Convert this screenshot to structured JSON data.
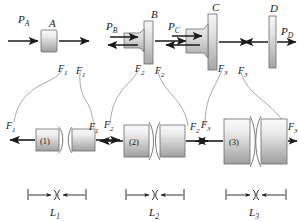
{
  "figure": {
    "kind": "free-body-diagram",
    "colors": {
      "ink": "#1a1a1a",
      "body_light": "#f0f0f0",
      "body_mid": "#c9c9c9",
      "body_dark": "#9a9a9a",
      "leader": "#8a8a8a",
      "background": "#ffffff"
    }
  },
  "top_row": {
    "bodies": [
      {
        "id": "A",
        "label": "A",
        "shape": "small-block",
        "applied_load": {
          "label": "P",
          "sub": "A",
          "display": "PA",
          "direction": "right"
        },
        "internal_force": {
          "label": "F",
          "sub": "1",
          "display": "F1",
          "direction": "right"
        }
      },
      {
        "id": "B",
        "label": "B",
        "shape": "flange-with-stepped-shaft",
        "applied_load": {
          "label": "P",
          "sub": "B",
          "display": "PB",
          "direction": "right"
        },
        "left_force": {
          "label": "F",
          "sub": "1",
          "display": "F1",
          "direction": "left"
        },
        "right_force": {
          "label": "F",
          "sub": "2",
          "display": "F2",
          "direction": "right"
        }
      },
      {
        "id": "C",
        "label": "C",
        "shape": "tall-flange-with-stepped-shaft",
        "applied_load": {
          "label": "P",
          "sub": "C",
          "display": "PC",
          "direction": "right"
        },
        "left_force": {
          "label": "F",
          "sub": "2",
          "display": "F2",
          "direction": "left"
        },
        "right_force": {
          "label": "F",
          "sub": "3",
          "display": "F3",
          "direction": "right"
        }
      },
      {
        "id": "D",
        "label": "D",
        "shape": "thin-plate",
        "applied_load": {
          "label": "P",
          "sub": "D",
          "display": "PD",
          "direction": "right"
        },
        "left_force": {
          "label": "F",
          "sub": "3",
          "display": "F3",
          "direction": "left"
        }
      }
    ]
  },
  "bottom_row": {
    "segments": [
      {
        "id": "1",
        "number": "(1)",
        "diameter_class": "small",
        "left_force": {
          "display": "F1",
          "label": "F",
          "sub": "1",
          "direction": "left"
        },
        "right_force": {
          "display": "F1",
          "label": "F",
          "sub": "1",
          "direction": "right"
        },
        "length_label": "L",
        "length_sub": "1",
        "length_display": "L1",
        "has_break_symbol": true
      },
      {
        "id": "2",
        "number": "(2)",
        "diameter_class": "medium",
        "left_force": {
          "display": "F2",
          "label": "F",
          "sub": "2",
          "direction": "left"
        },
        "right_force": {
          "display": "F2",
          "label": "F",
          "sub": "2",
          "direction": "right"
        },
        "length_label": "L",
        "length_sub": "2",
        "length_display": "L2",
        "has_break_symbol": true
      },
      {
        "id": "3",
        "number": "(3)",
        "diameter_class": "large",
        "left_force": {
          "display": "F3",
          "label": "F",
          "sub": "3",
          "direction": "left"
        },
        "right_force": {
          "display": "F3",
          "label": "F",
          "sub": "3",
          "direction": "right"
        },
        "length_label": "L",
        "length_sub": "3",
        "length_display": "L3",
        "has_break_symbol": true
      }
    ]
  },
  "leaders": {
    "count": 6,
    "description": "curved leader lines linking internal force labels in the top row to the matching labels on the segment free bodies below"
  }
}
